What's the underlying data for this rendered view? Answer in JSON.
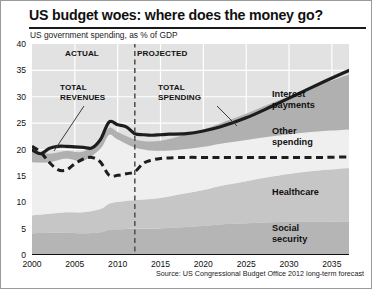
{
  "header": {
    "title": "US budget woes: where does the money go?",
    "subtitle": "US government spending, as % of GDP"
  },
  "source": "Source: US Congressional Budget Office 2012 long-term forecast",
  "annotations": {
    "actual": "ACTUAL",
    "projected": "PROJECTED",
    "total_revenues": "TOTAL\nREVENUES",
    "total_revenues_line1": "TOTAL",
    "total_revenues_line2": "REVENUES",
    "total_spending_line1": "TOTAL",
    "total_spending_line2": "SPENDING",
    "divider_year": 2012
  },
  "band_labels": {
    "interest_line1": "Interest",
    "interest_line2": "payments",
    "other_line1": "Other",
    "other_line2": "spending",
    "healthcare": "Healthcare",
    "social_line1": "Social",
    "social_line2": "security"
  },
  "colors": {
    "plot_background": "#e2e2e2",
    "gridline": "#ffffff",
    "social_security": "#b5b5b5",
    "healthcare": "#c6c6c6",
    "other_spending": "#efefef",
    "interest_payments": "#b0b0b0",
    "spending_line": "#1d1d1d",
    "revenue_line": "#1d1d1d",
    "axis": "#111111",
    "divider": "#555555"
  },
  "chart_data": {
    "type": "area",
    "title": "US budget woes: where does the money go?",
    "subtitle": "US government spending, as % of GDP",
    "xlabel": "",
    "ylabel": "% of GDP",
    "xlim": [
      2000,
      2037
    ],
    "ylim": [
      0,
      40
    ],
    "xticks": [
      2000,
      2005,
      2010,
      2015,
      2020,
      2025,
      2030,
      2035
    ],
    "yticks": [
      0,
      5,
      10,
      15,
      20,
      25,
      30,
      35,
      40
    ],
    "grid": true,
    "legend": "inline-band-labels",
    "x": [
      2000,
      2002,
      2004,
      2006,
      2008,
      2009,
      2010,
      2012,
      2014,
      2016,
      2018,
      2020,
      2022,
      2025,
      2028,
      2031,
      2034,
      2037
    ],
    "stacked_series": [
      {
        "name": "Social security",
        "values": [
          4.1,
          4.2,
          4.2,
          4.1,
          4.3,
          4.8,
          4.9,
          5.0,
          5.0,
          5.1,
          5.3,
          5.5,
          5.8,
          6.0,
          6.2,
          6.3,
          6.3,
          6.3
        ]
      },
      {
        "name": "Healthcare",
        "values": [
          3.4,
          3.6,
          3.9,
          4.0,
          4.4,
          4.9,
          5.2,
          5.4,
          5.6,
          6.0,
          6.4,
          6.8,
          7.3,
          8.0,
          8.7,
          9.3,
          9.8,
          10.2
        ]
      },
      {
        "name": "Other spending",
        "values": [
          10.1,
          9.8,
          10.2,
          9.8,
          11.5,
          13.1,
          11.8,
          10.0,
          9.2,
          8.7,
          8.4,
          8.2,
          8.0,
          7.8,
          7.6,
          7.5,
          7.4,
          7.3
        ]
      },
      {
        "name": "Interest payments",
        "values": [
          2.3,
          1.6,
          1.4,
          1.7,
          1.7,
          1.3,
          1.4,
          1.5,
          1.7,
          2.2,
          2.8,
          3.3,
          3.9,
          5.0,
          6.3,
          7.6,
          9.0,
          10.4
        ]
      }
    ],
    "lines": [
      {
        "name": "Total spending",
        "style": "solid",
        "x": [
          2000,
          2001,
          2002,
          2003,
          2004,
          2005,
          2006,
          2007,
          2008,
          2009,
          2010,
          2011,
          2012,
          2013,
          2014,
          2015,
          2016,
          2018,
          2020,
          2022,
          2025,
          2028,
          2031,
          2034,
          2037
        ],
        "values": [
          19.9,
          19.2,
          20.2,
          20.6,
          20.6,
          20.5,
          20.4,
          20.3,
          21.9,
          25.2,
          24.7,
          24.3,
          23.0,
          22.8,
          22.7,
          22.8,
          22.9,
          23.0,
          23.5,
          24.3,
          26.0,
          28.2,
          30.5,
          32.8,
          35.0
        ]
      },
      {
        "name": "Total revenues",
        "style": "dashed",
        "x": [
          2000,
          2001,
          2002,
          2003,
          2004,
          2005,
          2006,
          2007,
          2008,
          2009,
          2010,
          2011,
          2012,
          2013,
          2014,
          2015,
          2016,
          2018,
          2020,
          2022,
          2025,
          2028,
          2031,
          2034,
          2037
        ],
        "values": [
          20.6,
          19.5,
          17.6,
          16.2,
          16.1,
          17.3,
          18.2,
          18.5,
          17.6,
          15.1,
          15.1,
          15.4,
          15.8,
          17.4,
          18.0,
          18.3,
          18.4,
          18.5,
          18.5,
          18.5,
          18.5,
          18.5,
          18.5,
          18.5,
          18.6
        ]
      }
    ]
  }
}
